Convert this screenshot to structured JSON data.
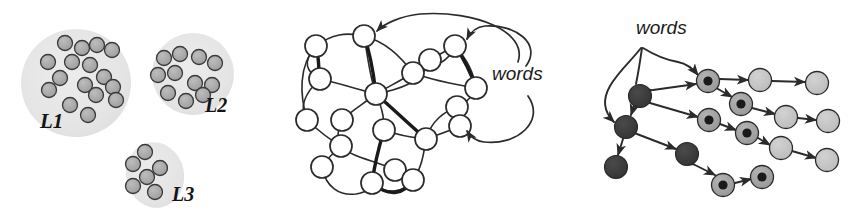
{
  "figure": {
    "background": "#ffffff",
    "width": 866,
    "height": 218,
    "panels": [
      "clusters",
      "network",
      "tree"
    ]
  },
  "palette": {
    "blob_fill": "#e6e6e6",
    "blob_fill_alt": "#e2e2e2",
    "dot_fill": "#a9a9a9",
    "dot_stroke": "#3a3a3a",
    "node_white_fill": "#ffffff",
    "node_stroke": "#2b2b2b",
    "edge": "#2b2b2b",
    "dark_node": "#3b3b3b",
    "mid_node": "#9e9e9e",
    "light_node": "#c2c2c2",
    "bullseye_core": "#1a1a1a",
    "label_color": "#141414"
  },
  "clusters": {
    "name": "language-clusters",
    "blobs": [
      {
        "id": "L1",
        "label": "L1",
        "label_x": 40,
        "label_y": 128,
        "label_size": 21,
        "cx": 76,
        "cy": 83,
        "rx": 55,
        "ry": 54,
        "rotate": -8,
        "dot_count": 16,
        "dots": [
          {
            "x": 65,
            "y": 43
          },
          {
            "x": 82,
            "y": 48
          },
          {
            "x": 97,
            "y": 45
          },
          {
            "x": 112,
            "y": 50
          },
          {
            "x": 48,
            "y": 62
          },
          {
            "x": 72,
            "y": 62
          },
          {
            "x": 90,
            "y": 65
          },
          {
            "x": 60,
            "y": 78
          },
          {
            "x": 104,
            "y": 77
          },
          {
            "x": 49,
            "y": 90
          },
          {
            "x": 85,
            "y": 85
          },
          {
            "x": 113,
            "y": 87
          },
          {
            "x": 96,
            "y": 95
          },
          {
            "x": 70,
            "y": 105
          },
          {
            "x": 116,
            "y": 100
          },
          {
            "x": 88,
            "y": 115
          }
        ]
      },
      {
        "id": "L2",
        "label": "L2",
        "label_x": 205,
        "label_y": 112,
        "label_size": 20,
        "cx": 193,
        "cy": 74,
        "rx": 41,
        "ry": 41,
        "rotate": 6,
        "dot_count": 11,
        "dots": [
          {
            "x": 164,
            "y": 58
          },
          {
            "x": 180,
            "y": 54
          },
          {
            "x": 199,
            "y": 57
          },
          {
            "x": 215,
            "y": 63
          },
          {
            "x": 158,
            "y": 75
          },
          {
            "x": 175,
            "y": 73
          },
          {
            "x": 195,
            "y": 83
          },
          {
            "x": 212,
            "y": 85
          },
          {
            "x": 168,
            "y": 93
          },
          {
            "x": 186,
            "y": 101
          },
          {
            "x": 203,
            "y": 95
          }
        ]
      },
      {
        "id": "L3",
        "label": "L3",
        "label_x": 172,
        "label_y": 201,
        "label_size": 20,
        "cx": 155,
        "cy": 175,
        "rx": 29,
        "ry": 33,
        "rotate": -12,
        "dot_count": 6,
        "dots": [
          {
            "x": 145,
            "y": 152
          },
          {
            "x": 133,
            "y": 164
          },
          {
            "x": 160,
            "y": 168
          },
          {
            "x": 147,
            "y": 177
          },
          {
            "x": 133,
            "y": 186
          },
          {
            "x": 155,
            "y": 192
          }
        ]
      }
    ],
    "dot_radius": 7.5
  },
  "network": {
    "name": "word-network",
    "label": "words",
    "label_x": 212,
    "label_y": 80,
    "label_size": 19,
    "node_radius": 11,
    "node_count": 19,
    "nodes": [
      {
        "id": "n1",
        "x": 36,
        "y": 46
      },
      {
        "id": "n2",
        "x": 84,
        "y": 36
      },
      {
        "id": "n3",
        "x": 175,
        "y": 46
      },
      {
        "id": "n4",
        "x": 40,
        "y": 79
      },
      {
        "id": "n5",
        "x": 133,
        "y": 73
      },
      {
        "id": "n6",
        "x": 96,
        "y": 94
      },
      {
        "id": "n7",
        "x": 196,
        "y": 88
      },
      {
        "id": "n8",
        "x": 177,
        "y": 107
      },
      {
        "id": "n9",
        "x": 27,
        "y": 120
      },
      {
        "id": "n10",
        "x": 104,
        "y": 130
      },
      {
        "id": "n11",
        "x": 61,
        "y": 146
      },
      {
        "id": "n12",
        "x": 146,
        "y": 139
      },
      {
        "id": "n13",
        "x": 180,
        "y": 126
      },
      {
        "id": "n14",
        "x": 42,
        "y": 167
      },
      {
        "id": "n15",
        "x": 92,
        "y": 183
      },
      {
        "id": "n16",
        "x": 133,
        "y": 180
      },
      {
        "id": "n17",
        "x": 115,
        "y": 170
      },
      {
        "id": "n18",
        "x": 150,
        "y": 60
      },
      {
        "id": "n19",
        "x": 62,
        "y": 120
      }
    ],
    "pointer_count": 3,
    "pointers": [
      {
        "to": "n2",
        "from_side": "right-top"
      },
      {
        "to": "n3",
        "from_side": "right-top"
      },
      {
        "to": "n13",
        "from_side": "right-bottom"
      }
    ]
  },
  "tree": {
    "name": "word-tree",
    "label": "words",
    "label_x": 40,
    "label_y": 34,
    "label_size": 19,
    "node_radius": 11.5,
    "node_count": 16,
    "legend": {
      "dark": "dark-filled-node",
      "bullseye": "bullseye-node",
      "light": "light-filled-node"
    },
    "nodes": [
      {
        "id": "t1",
        "x": 44,
        "y": 96,
        "kind": "dark"
      },
      {
        "id": "t2",
        "x": 30,
        "y": 127,
        "kind": "dark"
      },
      {
        "id": "t3",
        "x": 20,
        "y": 167,
        "kind": "dark"
      },
      {
        "id": "t4",
        "x": 91,
        "y": 154,
        "kind": "dark"
      },
      {
        "id": "t5",
        "x": 112,
        "y": 81,
        "kind": "bullseye"
      },
      {
        "id": "t6",
        "x": 145,
        "y": 104,
        "kind": "bullseye"
      },
      {
        "id": "t7",
        "x": 113,
        "y": 120,
        "kind": "bullseye"
      },
      {
        "id": "t8",
        "x": 151,
        "y": 133,
        "kind": "bullseye"
      },
      {
        "id": "t9",
        "x": 127,
        "y": 185,
        "kind": "bullseye"
      },
      {
        "id": "t10",
        "x": 166,
        "y": 177,
        "kind": "bullseye"
      },
      {
        "id": "t11",
        "x": 164,
        "y": 80,
        "kind": "light"
      },
      {
        "id": "t12",
        "x": 221,
        "y": 83,
        "kind": "light"
      },
      {
        "id": "t13",
        "x": 190,
        "y": 117,
        "kind": "light"
      },
      {
        "id": "t14",
        "x": 232,
        "y": 121,
        "kind": "light"
      },
      {
        "id": "t15",
        "x": 185,
        "y": 148,
        "kind": "light"
      },
      {
        "id": "t16",
        "x": 231,
        "y": 160,
        "kind": "light"
      }
    ],
    "edges": [
      {
        "from": "t1",
        "to": "t5",
        "arrows": "both"
      },
      {
        "from": "t1",
        "to": "t7",
        "arrows": "both"
      },
      {
        "from": "t1",
        "to": "t2",
        "arrows": "both"
      },
      {
        "from": "t2",
        "to": "t3",
        "arrows": "both"
      },
      {
        "from": "t2",
        "to": "t4",
        "arrows": "both"
      },
      {
        "from": "t4",
        "to": "t9",
        "arrows": "both"
      },
      {
        "from": "t5",
        "to": "t6",
        "arrows": "both"
      },
      {
        "from": "t5",
        "to": "t11",
        "arrows": "both"
      },
      {
        "from": "t7",
        "to": "t8",
        "arrows": "both"
      },
      {
        "from": "t6",
        "to": "t13",
        "arrows": "both"
      },
      {
        "from": "t8",
        "to": "t15",
        "arrows": "both"
      },
      {
        "from": "t9",
        "to": "t10",
        "arrows": "both"
      },
      {
        "from": "t11",
        "to": "t12",
        "arrows": "both"
      },
      {
        "from": "t13",
        "to": "t14",
        "arrows": "both"
      },
      {
        "from": "t15",
        "to": "t16",
        "arrows": "both"
      }
    ],
    "pointer_count": 2,
    "pointers": [
      {
        "to": "t5",
        "path": "over-right"
      },
      {
        "to": "t2",
        "path": "around-left"
      }
    ]
  }
}
